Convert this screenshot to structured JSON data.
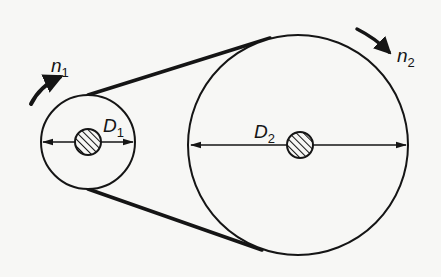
{
  "diagram": {
    "type": "belt-drive",
    "colors": {
      "background": "#f7f7f5",
      "ink": "#151515"
    },
    "pulley_small": {
      "diameter_label": {
        "main": "D",
        "sub": "1"
      },
      "speed_label": {
        "main": "n",
        "sub": "1"
      },
      "rotation": "clockwise",
      "center": [
        88,
        142
      ],
      "radius": 47,
      "shaft_radius": 13
    },
    "pulley_large": {
      "diameter_label": {
        "main": "D",
        "sub": "2"
      },
      "speed_label": {
        "main": "n",
        "sub": "2"
      },
      "rotation": "clockwise",
      "center": [
        298,
        145
      ],
      "radius": 110,
      "shaft_radius": 13
    },
    "belt": {
      "type": "open",
      "segments": 2
    }
  }
}
